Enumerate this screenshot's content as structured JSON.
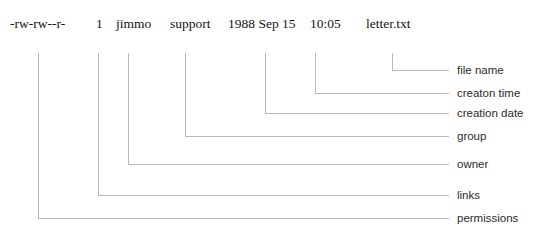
{
  "diagram": {
    "line_color": "#b9b9b9",
    "text_color": "#141414",
    "label_color": "#2b2b2b",
    "background": "#ffffff"
  },
  "listing": {
    "raw": "-rw-rw--r-    1   jimmo   support   1988 Sep 15   10:05   letter.txt",
    "fields": [
      {
        "key": "permissions",
        "text": "-rw-rw--r-",
        "x": 10,
        "tick_x": 38
      },
      {
        "key": "links",
        "text": "1",
        "x": 96,
        "tick_x": 98
      },
      {
        "key": "owner",
        "text": "jimmo",
        "x": 116,
        "tick_x": 128
      },
      {
        "key": "group",
        "text": "support",
        "x": 170,
        "tick_x": 185
      },
      {
        "key": "creation_date",
        "text": "1988 Sep 15",
        "x": 228,
        "tick_x": 265
      },
      {
        "key": "creation_time",
        "text": "10:05",
        "x": 310,
        "tick_x": 315
      },
      {
        "key": "file_name",
        "text": "letter.txt",
        "x": 366,
        "tick_x": 392
      }
    ]
  },
  "labels": [
    {
      "key": "file_name",
      "text": "file name",
      "y": 64,
      "tick_x": 392,
      "turn_y": 70,
      "end_x": 449
    },
    {
      "key": "creation_time",
      "text": "creaton time",
      "y": 87,
      "tick_x": 315,
      "turn_y": 93,
      "end_x": 449
    },
    {
      "key": "creation_date",
      "text": "creation date",
      "y": 107,
      "tick_x": 265,
      "turn_y": 113,
      "end_x": 449
    },
    {
      "key": "group",
      "text": "group",
      "y": 130,
      "tick_x": 185,
      "turn_y": 136,
      "end_x": 449
    },
    {
      "key": "owner",
      "text": "owner",
      "y": 158,
      "tick_x": 128,
      "turn_y": 164,
      "end_x": 449
    },
    {
      "key": "links",
      "text": "links",
      "y": 189,
      "tick_x": 98,
      "turn_y": 195,
      "end_x": 449
    },
    {
      "key": "permissions",
      "text": "permissions",
      "y": 212,
      "tick_x": 38,
      "turn_y": 218,
      "end_x": 449
    }
  ],
  "leader_start_y": 53
}
